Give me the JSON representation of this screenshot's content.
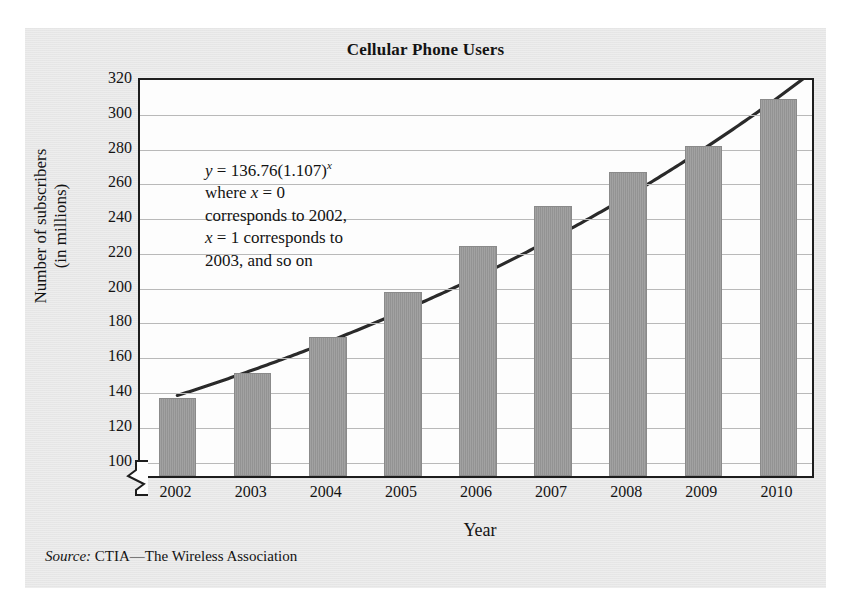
{
  "chart_data": {
    "type": "bar",
    "title": "Cellular Phone Users",
    "xlabel": "Year",
    "ylabel": "Number of subscribers (in millions)",
    "ylabel_line1": "Number of subscribers",
    "ylabel_line2": "(in millions)",
    "categories": [
      "2002",
      "2003",
      "2004",
      "2005",
      "2006",
      "2007",
      "2008",
      "2009",
      "2010"
    ],
    "values": [
      135,
      149,
      170,
      196,
      222,
      245,
      265,
      280,
      307
    ],
    "series": [
      {
        "name": "Number of subscribers (in millions)",
        "type": "bar",
        "values": [
          135,
          149,
          170,
          196,
          222,
          245,
          265,
          280,
          307
        ]
      },
      {
        "name": "y = 136.76(1.107)^x",
        "type": "line",
        "x": [
          0,
          1,
          2,
          3,
          4,
          5,
          6,
          7,
          8
        ],
        "values": [
          136.76,
          151.39,
          167.59,
          185.52,
          205.37,
          227.34,
          251.67,
          278.6,
          308.41
        ]
      }
    ],
    "ylim": [
      90,
      320
    ],
    "y_ticks": [
      100,
      120,
      140,
      160,
      180,
      200,
      220,
      240,
      260,
      280,
      300,
      320
    ],
    "grid": true,
    "legend": false,
    "y_axis_break": true,
    "bar_color": "#9b9b9b",
    "curve_color": "#2a2a2a",
    "gridline_color": "#b9b9b9",
    "axis_color": "#1d1d1d",
    "panel_color": "#e8e8e8",
    "plot_background": "#fdfdfd"
  },
  "annotation": {
    "equation_prefix": "y",
    "equation_equals": " = 136.76(1.107)",
    "equation_exponent": "x",
    "line2_prefix": "where ",
    "line2_var": "x",
    "line2_rest": " = 0",
    "line3": "corresponds to 2002,",
    "line4_var": "x",
    "line4_rest": " = 1 corresponds to",
    "line5": "2003, and so on",
    "full_text": "y = 136.76(1.107)^x where x = 0 corresponds to 2002, x = 1 corresponds to 2003, and so on"
  },
  "source": {
    "label": "Source:",
    "text": " CTIA—The Wireless Association"
  }
}
